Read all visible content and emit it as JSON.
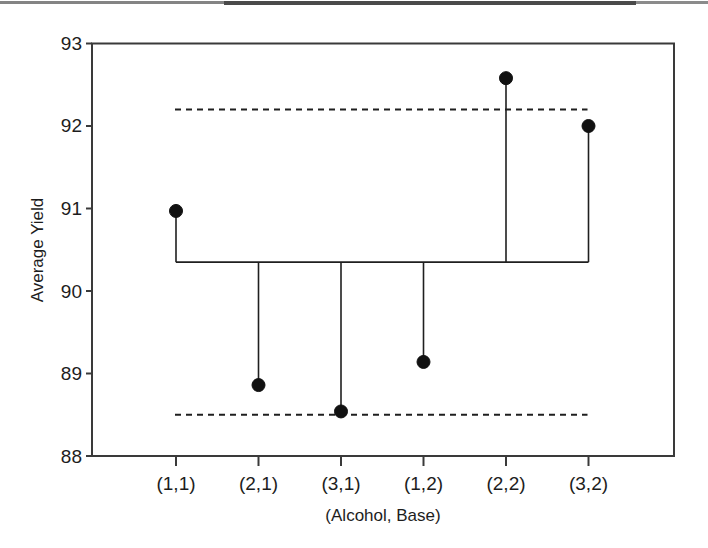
{
  "figure": {
    "plot_type": "half-normal-style effects plot (stem plot with decision limits)"
  },
  "chart_data": {
    "type": "scatter",
    "title": "",
    "xlabel": "(Alcohol, Base)",
    "ylabel": "Average Yield",
    "categories": [
      "(1,1)",
      "(2,1)",
      "(3,1)",
      "(1,2)",
      "(2,2)",
      "(3,2)"
    ],
    "values": [
      90.97,
      88.86,
      88.54,
      89.14,
      92.58,
      92.0
    ],
    "ylim": [
      88,
      93
    ],
    "yticks": [
      88,
      89,
      90,
      91,
      92,
      93
    ],
    "ytick_labels": [
      "88",
      "89",
      "90",
      "91",
      "92",
      "93"
    ],
    "grid": false,
    "legend": "none",
    "reference_line": {
      "label": "center line",
      "value": 90.35,
      "style": "solid"
    },
    "decision_limits": [
      {
        "label": "upper decision limit",
        "value": 92.2,
        "style": "dashed"
      },
      {
        "label": "lower decision limit",
        "value": 88.5,
        "style": "dashed"
      }
    ],
    "series": [
      {
        "name": "Average Yield",
        "points": [
          {
            "category": "(1,1)",
            "value": 90.97
          },
          {
            "category": "(2,1)",
            "value": 88.86
          },
          {
            "category": "(3,1)",
            "value": 88.54
          },
          {
            "category": "(1,2)",
            "value": 89.14
          },
          {
            "category": "(2,2)",
            "value": 92.58
          },
          {
            "category": "(3,2)",
            "value": 92.0
          }
        ]
      }
    ],
    "colors": {
      "marker": "#111111",
      "axis": "#3a3a3a",
      "line": "#1f1f1f",
      "background": "#ffffff"
    }
  }
}
